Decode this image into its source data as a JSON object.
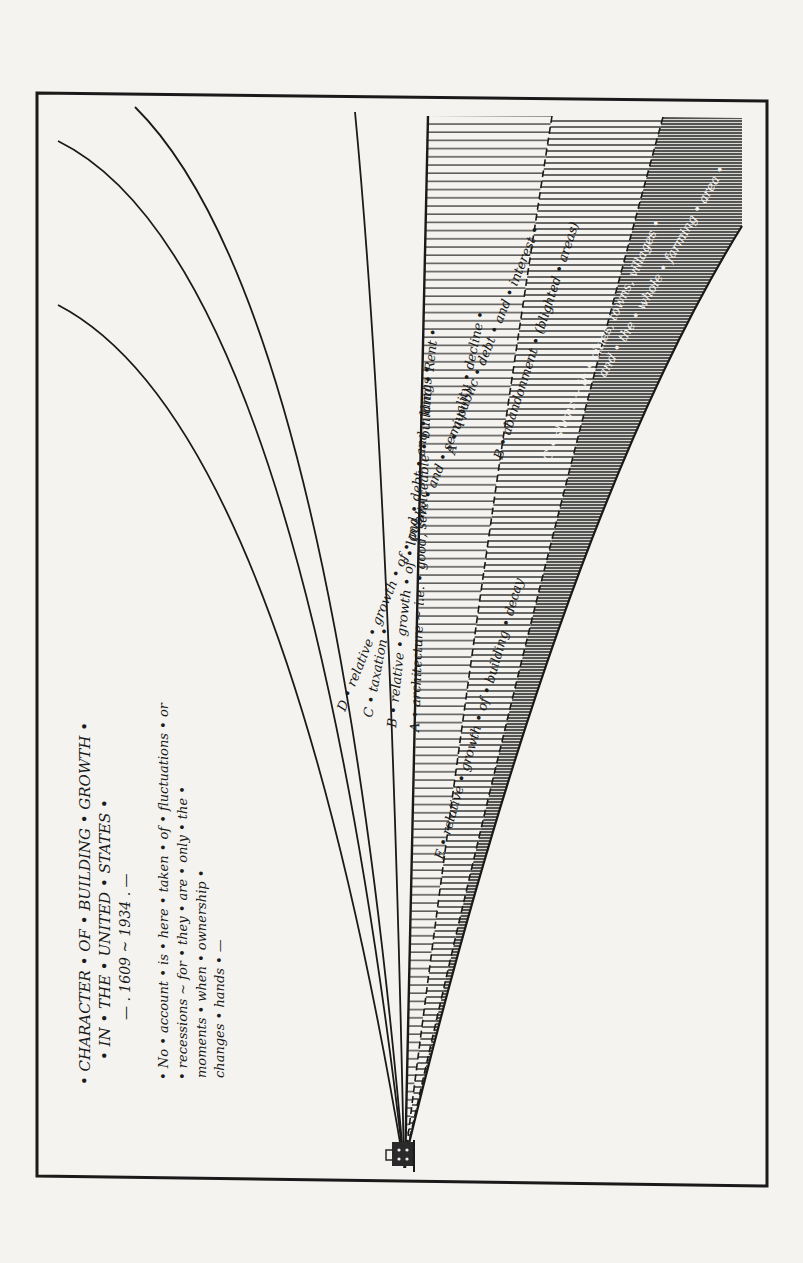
{
  "diagram": {
    "title": {
      "line1": "• CHARACTER • OF • BUILDING • GROWTH •",
      "line2": "• IN • THE • UNITED • STATES •",
      "line3": "— . 1609 ~ 1934 . —"
    },
    "note": {
      "line1": "• No • account • is • here • taken • of • fluctuations • or",
      "line2": "• recessions ~ for • they • are • only • the •",
      "line3": "moments • when • ownership •",
      "line4": "changes • hands • —"
    },
    "curves": {
      "public_debt": "D • relative • growth • of • public • and • semi-public • debt • and • interest •",
      "taxation": "C • taxation •",
      "land_rent": "B • relative • growth • of • land • debt • and • land • Rent •",
      "architecture": "A • architecture ~ i.e. • good, serviceable • buildings •"
    },
    "decay": {
      "label": "E • relative • growth • of • building • decay",
      "a": "A • quality • decline •",
      "b": "B • abandonment • (blighted • areas)",
      "c": "C • slums ~ in • cities, towns, villages •",
      "c_cont": "and • the • whole • farming • area •"
    },
    "origin_icon": "house-icon",
    "colors": {
      "paper": "#f4f3ef",
      "ink": "#1a1a1a",
      "dense_hatch": "#3a3a3a"
    }
  }
}
